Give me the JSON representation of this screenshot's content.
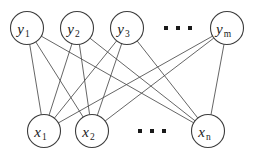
{
  "diagram": {
    "type": "bipartite-graph",
    "background_color": "#ffffff",
    "node_stroke_color": "#3c3c3c",
    "node_fill_color": "#ffffff",
    "edge_color": "#4a4a4a",
    "text_color": "#1a1a1a",
    "node_radius": 16.5,
    "top_layer": {
      "name": "y-layer",
      "row_center_y": 28,
      "nodes": [
        {
          "id": "y1",
          "base": "y",
          "subscript": "1",
          "cx": 27,
          "cy": 28
        },
        {
          "id": "y2",
          "base": "y",
          "subscript": "2",
          "cx": 77,
          "cy": 28
        },
        {
          "id": "y3",
          "base": "y",
          "subscript": "3",
          "cx": 127,
          "cy": 28
        },
        {
          "id": "ym",
          "base": "y",
          "subscript": "m",
          "cx": 227,
          "cy": 28
        }
      ],
      "ellipsis": {
        "cx": 178,
        "cy": 28,
        "dot_count": 3,
        "dot_size": 4,
        "dot_gap": 12
      }
    },
    "bottom_layer": {
      "name": "x-layer",
      "row_center_y": 131,
      "nodes": [
        {
          "id": "x1",
          "base": "x",
          "subscript": "1",
          "cx": 44,
          "cy": 131
        },
        {
          "id": "x2",
          "base": "x",
          "subscript": "2",
          "cx": 92,
          "cy": 131
        },
        {
          "id": "xn",
          "base": "x",
          "subscript": "n",
          "cx": 208,
          "cy": 131
        }
      ],
      "ellipsis": {
        "cx": 152,
        "cy": 131,
        "dot_count": 3,
        "dot_size": 4,
        "dot_gap": 12
      }
    },
    "edges": [
      {
        "from": "y1",
        "to": "x1"
      },
      {
        "from": "y1",
        "to": "x2"
      },
      {
        "from": "y1",
        "to": "xn"
      },
      {
        "from": "y2",
        "to": "x1"
      },
      {
        "from": "y2",
        "to": "x2"
      },
      {
        "from": "y2",
        "to": "xn"
      },
      {
        "from": "y3",
        "to": "x1"
      },
      {
        "from": "y3",
        "to": "x2"
      },
      {
        "from": "y3",
        "to": "xn"
      },
      {
        "from": "ym",
        "to": "x1"
      },
      {
        "from": "ym",
        "to": "x2"
      },
      {
        "from": "ym",
        "to": "xn"
      }
    ]
  }
}
